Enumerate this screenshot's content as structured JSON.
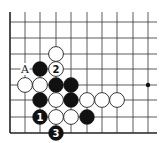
{
  "diagram": {
    "type": "go-board-problem",
    "grid": {
      "col_x": [
        10,
        25,
        40,
        56,
        71,
        87,
        102,
        117,
        133,
        148
      ],
      "row_y": [
        22,
        38,
        54,
        69,
        85,
        100,
        117,
        133
      ],
      "top_extend_y": 12,
      "right_extend_x": 157,
      "left_edge": true,
      "bottom_edge": true,
      "line_color": "#333333",
      "edge_color": "#222222"
    },
    "star_points": [
      {
        "col": 9,
        "row": 4
      }
    ],
    "stones": [
      {
        "color": "white",
        "col": 3,
        "row": 2,
        "label": ""
      },
      {
        "color": "black",
        "col": 2,
        "row": 3,
        "label": ""
      },
      {
        "color": "white",
        "col": 3,
        "row": 3,
        "label": "2"
      },
      {
        "color": "white",
        "col": 1,
        "row": 4,
        "label": ""
      },
      {
        "color": "white",
        "col": 2,
        "row": 4,
        "label": ""
      },
      {
        "color": "black",
        "col": 3,
        "row": 4,
        "label": ""
      },
      {
        "color": "black",
        "col": 4,
        "row": 4,
        "label": ""
      },
      {
        "color": "black",
        "col": 2,
        "row": 5,
        "label": ""
      },
      {
        "color": "white",
        "col": 3,
        "row": 5,
        "label": ""
      },
      {
        "color": "black",
        "col": 4,
        "row": 5,
        "label": ""
      },
      {
        "color": "white",
        "col": 5,
        "row": 5,
        "label": ""
      },
      {
        "color": "white",
        "col": 6,
        "row": 5,
        "label": ""
      },
      {
        "color": "white",
        "col": 7,
        "row": 5,
        "label": ""
      },
      {
        "color": "black",
        "col": 2,
        "row": 6,
        "label": "1"
      },
      {
        "color": "white",
        "col": 3,
        "row": 6,
        "label": ""
      },
      {
        "color": "white",
        "col": 4,
        "row": 6,
        "label": ""
      },
      {
        "color": "black",
        "col": 5,
        "row": 6,
        "label": ""
      },
      {
        "color": "black",
        "col": 3,
        "row": 7,
        "label": "3"
      }
    ],
    "point_labels": [
      {
        "text": "A",
        "col": 1,
        "row": 3
      }
    ],
    "colors": {
      "black_stone": "#111111",
      "white_stone": "#ffffff",
      "stone_outline": "#222222",
      "background": "#ffffff"
    }
  }
}
